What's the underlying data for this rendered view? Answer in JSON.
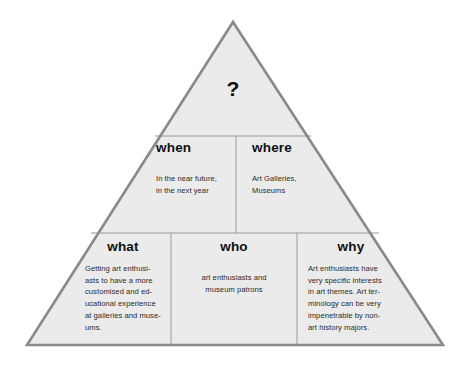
{
  "diagram": {
    "shape": "triangle",
    "fill_color": "#ebebeb",
    "outer_border_color": "#8a8a8a",
    "inner_divider_color": "#9a9a9a",
    "text_color": "#111111",
    "background_color": "#ffffff",
    "apex": {
      "icon_label": "question-mark",
      "mark": "?"
    },
    "rows": [
      {
        "row_name": "middle-row",
        "cells": [
          {
            "key": "when",
            "heading": "when",
            "body": "In the near future,\nin the next year"
          },
          {
            "key": "where",
            "heading": "where",
            "body": "Art Galleries,\nMuseums"
          }
        ]
      },
      {
        "row_name": "bottom-row",
        "cells": [
          {
            "key": "what",
            "heading": "what",
            "body": "Getting art enthusi-\nasts to have a more\ncustomised and ed-\nucational experience\nat galleries and muse-\nums."
          },
          {
            "key": "who",
            "heading": "who",
            "body": "art enthusiasts and\nmuseum patrons"
          },
          {
            "key": "why",
            "heading": "why",
            "body": "Art enthusiasts have\nvery specific interests\nin art themes. Art ter-\nminology can be very\nimpenetrable by non-\nart history majors."
          }
        ]
      }
    ]
  }
}
